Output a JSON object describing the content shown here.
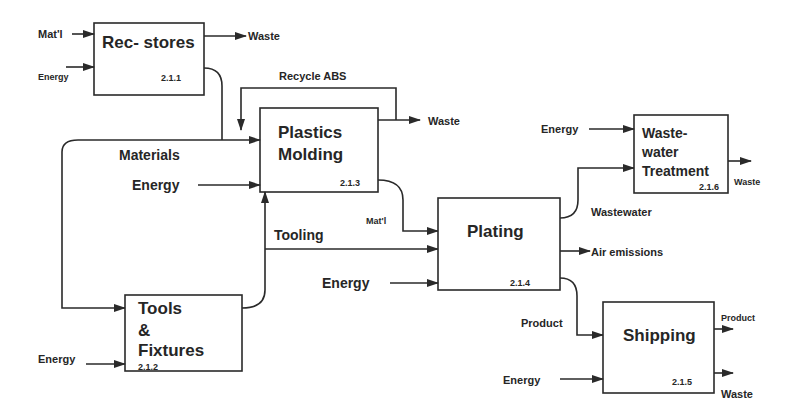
{
  "diagram": {
    "boxes": {
      "rec_stores": {
        "title": "Rec- stores",
        "id": "2.1.1"
      },
      "plastics_molding": {
        "line1": "Plastics",
        "line2": "Molding",
        "id": "2.1.3"
      },
      "wastewater_treatment": {
        "line1": "Waste-",
        "line2": "water",
        "line3": "Treatment",
        "id": "2.1.6"
      },
      "plating": {
        "title": "Plating",
        "id": "2.1.4"
      },
      "tools_fixtures": {
        "line1": "Tools",
        "line2": "&",
        "line3": "Fixtures",
        "id": "2.1.2"
      },
      "shipping": {
        "title": "Shipping",
        "id": "2.1.5"
      }
    },
    "labels": {
      "rec_matl_in": "Mat'l",
      "rec_energy_in": "Energy",
      "rec_waste_out": "Waste",
      "recycle_abs": "Recycle ABS",
      "molding_waste_out": "Waste",
      "materials": "Materials",
      "molding_energy_in": "Energy",
      "tooling": "Tooling",
      "matl_to_plating": "Mat'l",
      "plating_energy_in": "Energy",
      "wwt_energy_in": "Energy",
      "wastewater": "Wastewater",
      "wwt_waste_out": "Waste",
      "air_emissions": "Air emissions",
      "product_to_shipping": "Product",
      "tools_energy_in": "Energy",
      "shipping_energy_in": "Energy",
      "shipping_product_out": "Product",
      "shipping_waste_out": "Waste"
    },
    "colors": {
      "ink": "#262626",
      "background": "#ffffff"
    }
  }
}
